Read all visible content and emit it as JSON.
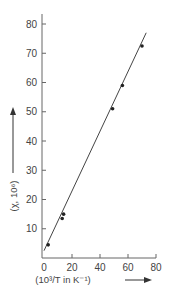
{
  "chart_data": {
    "type": "scatter",
    "title": "",
    "xlabel": "(10³/T in K⁻¹)",
    "ylabel": "(χ, 10⁶)",
    "xlim": [
      0,
      80
    ],
    "ylim": [
      0,
      85
    ],
    "x_ticks": [
      "0",
      "20",
      "40",
      "60",
      "80"
    ],
    "y_ticks": [
      "10",
      "20",
      "30",
      "40",
      "50",
      "60",
      "70",
      "80"
    ],
    "grid": false,
    "legend": null,
    "series": [
      {
        "name": "measured",
        "x": [
          3,
          13,
          14,
          49,
          56,
          70
        ],
        "y": [
          4.5,
          13.5,
          15,
          51,
          59,
          72.5
        ]
      }
    ],
    "fit_line": {
      "x": [
        0,
        73
      ],
      "y": [
        2.5,
        77
      ]
    },
    "annotations": [
      "arrow along y-axis label pointing up",
      "arrow after x-axis label pointing right"
    ]
  }
}
